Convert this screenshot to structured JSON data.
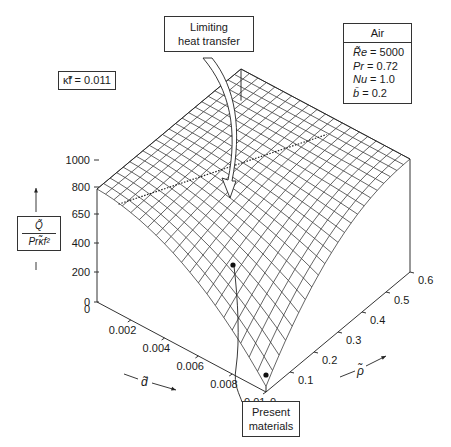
{
  "chart_data": {
    "type": "surface3d",
    "title": "",
    "zlabel": "Q / (Pr κ_f^2)",
    "xlabel": "d",
    "ylabel": "ρ",
    "z_ticks": [
      "0",
      "200",
      "400",
      "650",
      "800",
      "1000"
    ],
    "x_ticks": [
      "0",
      "0.002",
      "0.004",
      "0.006",
      "0.008",
      "0.01"
    ],
    "y_ticks": [
      "0",
      "0.1",
      "0.2",
      "0.3",
      "0.4",
      "0.5",
      "0.6"
    ],
    "zlim": [
      0,
      1000
    ],
    "xlim": [
      0,
      0.01
    ],
    "ylim": [
      0,
      0.6
    ],
    "surface_description": "Heat transfer surface: plateau at ~1000 for small d and large ρ; falls toward 0 as d→0.01 and ρ→0",
    "dotted_line_level": 1000,
    "present_materials_point": {
      "d": 0.01,
      "rho": 0.0,
      "z": 400
    },
    "annotations": [
      "Limiting heat transfer",
      "Present materials"
    ],
    "parameters": {
      "fluid": "Air",
      "Re": 5000,
      "Pr": 0.72,
      "Nu": 1.0,
      "b": 0.2,
      "kappa_f": 0.011
    }
  },
  "labels": {
    "kappa_box": "κ̃f = 0.011",
    "limiting_line1": "Limiting",
    "limiting_line2": "heat transfer",
    "present_line1": "Present",
    "present_line2": "materials",
    "air_header": "Air",
    "re_sym": "R̃e",
    "re_val": " = 5000",
    "pr_sym": "Pr",
    "pr_val": " = 0.72",
    "nu_sym": "Nu",
    "nu_val": " = 1.0",
    "b_sym": "b̄",
    "b_val": " = 0.2",
    "y_num": "Q̃",
    "y_den": "Prκ̃f²",
    "d_axis": "d̃",
    "rho_axis": "ρ̃"
  }
}
